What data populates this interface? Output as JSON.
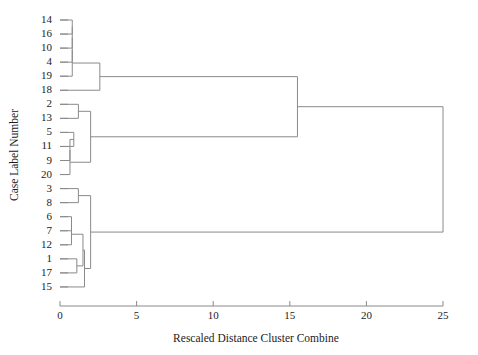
{
  "chart_data": {
    "type": "dendrogram",
    "title": "",
    "xlabel": "Rescaled Distance Cluster Combine",
    "ylabel": "Case Label Number",
    "xlim": [
      0,
      25
    ],
    "xticks": [
      0,
      5,
      10,
      15,
      20,
      25
    ],
    "xtick_labels": [
      "0",
      "5",
      "10",
      "15",
      "20",
      "25"
    ],
    "grid": false,
    "legend": null,
    "leaf_order": [
      "14",
      "16",
      "10",
      "4",
      "19",
      "18",
      "2",
      "13",
      "5",
      "11",
      "9",
      "20",
      "3",
      "8",
      "6",
      "7",
      "12",
      "1",
      "17",
      "15"
    ],
    "leaves": [
      {
        "label": "14",
        "position": 0
      },
      {
        "label": "16",
        "position": 1
      },
      {
        "label": "10",
        "position": 2
      },
      {
        "label": "4",
        "position": 3
      },
      {
        "label": "19",
        "position": 4
      },
      {
        "label": "18",
        "position": 5
      },
      {
        "label": "2",
        "position": 6
      },
      {
        "label": "13",
        "position": 7
      },
      {
        "label": "5",
        "position": 8
      },
      {
        "label": "11",
        "position": 9
      },
      {
        "label": "9",
        "position": 10
      },
      {
        "label": "20",
        "position": 11
      },
      {
        "label": "3",
        "position": 12
      },
      {
        "label": "8",
        "position": 13
      },
      {
        "label": "6",
        "position": 14
      },
      {
        "label": "7",
        "position": 15
      },
      {
        "label": "12",
        "position": 16
      },
      {
        "label": "1",
        "position": 17
      },
      {
        "label": "17",
        "position": 18
      },
      {
        "label": "15",
        "position": 19
      }
    ],
    "merges": [
      {
        "id": "m1",
        "left": "leaf:14",
        "right": "leaf:16",
        "distance": 0.8
      },
      {
        "id": "m2",
        "left": "m1",
        "right": "leaf:10",
        "distance": 0.8
      },
      {
        "id": "m3",
        "left": "m2",
        "right": "leaf:4",
        "distance": 0.8
      },
      {
        "id": "m4",
        "left": "m3",
        "right": "leaf:19",
        "distance": 0.8
      },
      {
        "id": "m5",
        "left": "m4",
        "right": "leaf:18",
        "distance": 2.6
      },
      {
        "id": "m6",
        "left": "leaf:2",
        "right": "leaf:13",
        "distance": 1.2
      },
      {
        "id": "m7",
        "left": "leaf:5",
        "right": "leaf:11",
        "distance": 0.9
      },
      {
        "id": "m8",
        "left": "m7",
        "right": "leaf:9",
        "distance": 0.65
      },
      {
        "id": "m9",
        "left": "m8",
        "right": "leaf:20",
        "distance": 0.65
      },
      {
        "id": "m10",
        "left": "m6",
        "right": "m9",
        "distance": 2.0
      },
      {
        "id": "m11",
        "left": "m5",
        "right": "m10",
        "distance": 15.5
      },
      {
        "id": "m12",
        "left": "leaf:3",
        "right": "leaf:8",
        "distance": 1.2
      },
      {
        "id": "m13",
        "left": "leaf:6",
        "right": "leaf:7",
        "distance": 0.75
      },
      {
        "id": "m14",
        "left": "m13",
        "right": "leaf:12",
        "distance": 0.75
      },
      {
        "id": "m15",
        "left": "leaf:1",
        "right": "leaf:17",
        "distance": 1.1
      },
      {
        "id": "m16",
        "left": "m14",
        "right": "m15",
        "distance": 1.5
      },
      {
        "id": "m17",
        "left": "m16",
        "right": "leaf:15",
        "distance": 1.6
      },
      {
        "id": "m18",
        "left": "m12",
        "right": "m17",
        "distance": 2.0
      },
      {
        "id": "m19",
        "left": "m11",
        "right": "m18",
        "distance": 25.0
      }
    ],
    "colors": {
      "line": "#8a8a8a",
      "text": "#1c1c1c",
      "background": "#ffffff"
    }
  }
}
